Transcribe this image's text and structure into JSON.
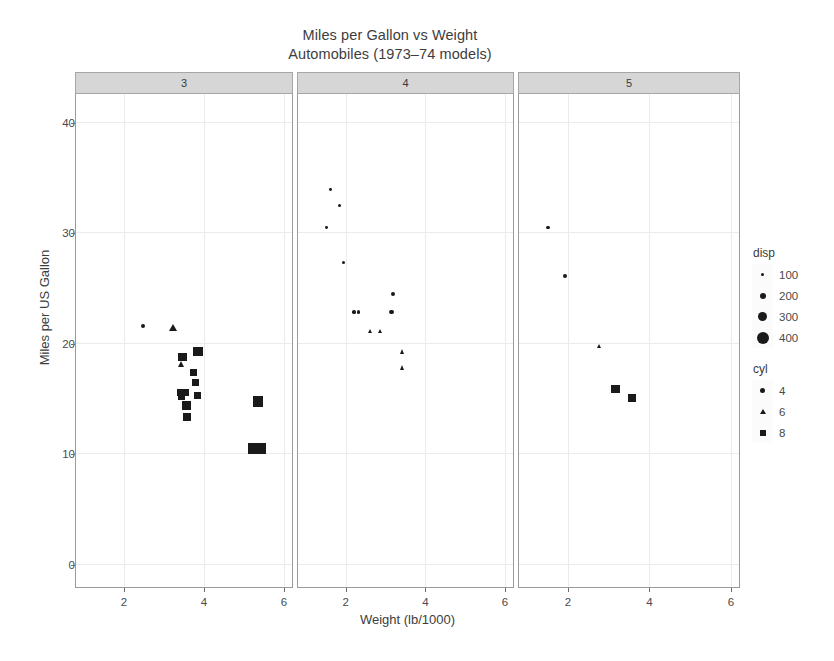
{
  "chart_data": {
    "type": "scatter",
    "title": "Miles per Gallon vs Weight",
    "subtitle": "Automobiles (1973–74 models)",
    "xlabel": "Weight (lb/1000)",
    "ylabel": "Miles per US Gallon",
    "xlim": [
      0.8,
      6.2
    ],
    "ylim": [
      -2.0,
      42.5
    ],
    "xticks": [
      2,
      4,
      6
    ],
    "yticks": [
      0,
      10,
      20,
      30,
      40
    ],
    "grid": true,
    "facet_var": "gear",
    "facet_labels": [
      "3",
      "4",
      "5"
    ],
    "size_var": "disp",
    "shape_var": "cyl",
    "point_color": "#1a1a1a",
    "panels": [
      {
        "label": "3",
        "points": [
          {
            "wt": 2.465,
            "mpg": 21.5,
            "cyl": 4,
            "disp": 120.1
          },
          {
            "wt": 3.215,
            "mpg": 21.4,
            "cyl": 6,
            "disp": 258.0
          },
          {
            "wt": 3.44,
            "mpg": 18.1,
            "cyl": 6,
            "disp": 225.0
          },
          {
            "wt": 3.46,
            "mpg": 18.7,
            "cyl": 8,
            "disp": 360.0
          },
          {
            "wt": 3.57,
            "mpg": 14.3,
            "cyl": 8,
            "disp": 360.0
          },
          {
            "wt": 3.73,
            "mpg": 17.3,
            "cyl": 8,
            "disp": 275.8
          },
          {
            "wt": 3.78,
            "mpg": 16.4,
            "cyl": 8,
            "disp": 275.8
          },
          {
            "wt": 3.84,
            "mpg": 15.2,
            "cyl": 8,
            "disp": 275.8
          },
          {
            "wt": 3.845,
            "mpg": 19.2,
            "cyl": 8,
            "disp": 400.0
          },
          {
            "wt": 3.435,
            "mpg": 15.5,
            "cyl": 8,
            "disp": 318.0
          },
          {
            "wt": 3.52,
            "mpg": 15.5,
            "cyl": 8,
            "disp": 304.0
          },
          {
            "wt": 3.435,
            "mpg": 15.2,
            "cyl": 8,
            "disp": 304.0
          },
          {
            "wt": 3.57,
            "mpg": 13.3,
            "cyl": 8,
            "disp": 350.0
          },
          {
            "wt": 5.25,
            "mpg": 10.4,
            "cyl": 8,
            "disp": 472.0
          },
          {
            "wt": 5.424,
            "mpg": 10.4,
            "cyl": 8,
            "disp": 460.0
          },
          {
            "wt": 5.345,
            "mpg": 14.7,
            "cyl": 8,
            "disp": 440.0
          }
        ]
      },
      {
        "label": "4",
        "points": [
          {
            "wt": 1.615,
            "mpg": 33.9,
            "cyl": 4,
            "disp": 71.1
          },
          {
            "wt": 1.835,
            "mpg": 32.4,
            "cyl": 4,
            "disp": 78.7
          },
          {
            "wt": 1.513,
            "mpg": 30.4,
            "cyl": 4,
            "disp": 75.7
          },
          {
            "wt": 1.935,
            "mpg": 27.3,
            "cyl": 4,
            "disp": 79.0
          },
          {
            "wt": 2.2,
            "mpg": 22.8,
            "cyl": 4,
            "disp": 108.0
          },
          {
            "wt": 2.32,
            "mpg": 22.8,
            "cyl": 4,
            "disp": 108.0
          },
          {
            "wt": 2.62,
            "mpg": 21.0,
            "cyl": 6,
            "disp": 160.0
          },
          {
            "wt": 2.875,
            "mpg": 21.0,
            "cyl": 6,
            "disp": 160.0
          },
          {
            "wt": 3.15,
            "mpg": 22.8,
            "cyl": 4,
            "disp": 140.8
          },
          {
            "wt": 3.19,
            "mpg": 24.4,
            "cyl": 4,
            "disp": 146.7
          },
          {
            "wt": 3.44,
            "mpg": 19.2,
            "cyl": 6,
            "disp": 167.6
          },
          {
            "wt": 3.44,
            "mpg": 17.8,
            "cyl": 6,
            "disp": 167.6
          }
        ]
      },
      {
        "label": "5",
        "points": [
          {
            "wt": 1.513,
            "mpg": 30.4,
            "cyl": 4,
            "disp": 95.1
          },
          {
            "wt": 1.935,
            "mpg": 26.0,
            "cyl": 4,
            "disp": 120.3
          },
          {
            "wt": 2.77,
            "mpg": 19.7,
            "cyl": 6,
            "disp": 145.0
          },
          {
            "wt": 3.17,
            "mpg": 15.8,
            "cyl": 8,
            "disp": 351.0
          },
          {
            "wt": 3.57,
            "mpg": 15.0,
            "cyl": 8,
            "disp": 301.0
          }
        ]
      }
    ],
    "legends": [
      {
        "title": "disp",
        "type": "size",
        "entries": [
          {
            "label": "100",
            "shape": "circle",
            "size": 3
          },
          {
            "label": "200",
            "shape": "circle",
            "size": 6
          },
          {
            "label": "300",
            "shape": "circle",
            "size": 9
          },
          {
            "label": "400",
            "shape": "circle",
            "size": 12
          }
        ]
      },
      {
        "title": "cyl",
        "type": "shape",
        "entries": [
          {
            "label": "4",
            "shape": "circle",
            "size": 5
          },
          {
            "label": "6",
            "shape": "triangle",
            "size": 6
          },
          {
            "label": "8",
            "shape": "square",
            "size": 6
          }
        ]
      }
    ]
  }
}
